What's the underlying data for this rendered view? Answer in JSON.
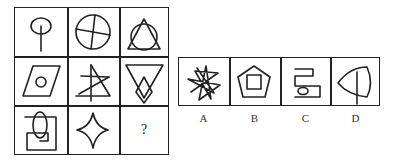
{
  "puzzle": {
    "type": "figure-reasoning-3x3",
    "grid": {
      "rows": [
        [
          "circle-with-vertical-stem",
          "circle-with-cross",
          "triangle-over-circle"
        ],
        [
          "parallelogram-with-small-circle",
          "crossed-triangle-strokes",
          "inverted-triangle-with-diamond"
        ],
        [
          "square-spiral-with-ellipse",
          "four-point-star",
          "missing"
        ]
      ],
      "missing_label": "?"
    },
    "options": [
      {
        "label": "A",
        "figure": "scribbled-star"
      },
      {
        "label": "B",
        "figure": "pentagon-with-square"
      },
      {
        "label": "C",
        "figure": "meander-with-small-ellipse"
      },
      {
        "label": "D",
        "figure": "leaf-shape-with-vertical-line"
      }
    ]
  }
}
